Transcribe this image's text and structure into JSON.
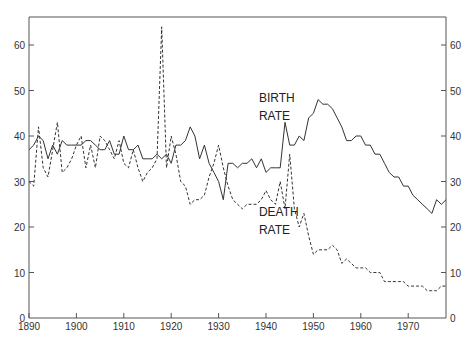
{
  "chart_data": {
    "type": "line",
    "title": "",
    "xlabel": "",
    "ylabel": "",
    "xlim": [
      1890,
      1978
    ],
    "ylim": [
      0,
      66
    ],
    "grid": false,
    "legend": "inline annotations",
    "x_ticks": [
      1890,
      1900,
      1910,
      1920,
      1930,
      1940,
      1950,
      1960,
      1970
    ],
    "y_ticks_left": [
      0,
      10,
      20,
      30,
      40,
      50,
      60
    ],
    "y_ticks_right": [
      0,
      10,
      20,
      30,
      40,
      50,
      60
    ],
    "annotations": [
      {
        "text": "BIRTH",
        "x": 1938.5,
        "y": 47.5
      },
      {
        "text": "RATE",
        "x": 1938.5,
        "y": 43.5
      },
      {
        "text": "DEATH",
        "x": 1938.5,
        "y": 22.5
      },
      {
        "text": "RATE",
        "x": 1938.5,
        "y": 18.5
      }
    ],
    "series": [
      {
        "name": "BIRTH RATE",
        "style": "solid",
        "x": [
          1890,
          1891,
          1892,
          1893,
          1894,
          1895,
          1896,
          1897,
          1898,
          1899,
          1900,
          1901,
          1902,
          1903,
          1904,
          1905,
          1906,
          1907,
          1908,
          1909,
          1910,
          1911,
          1912,
          1913,
          1914,
          1915,
          1916,
          1917,
          1918,
          1919,
          1920,
          1921,
          1922,
          1923,
          1924,
          1925,
          1926,
          1927,
          1928,
          1929,
          1930,
          1931,
          1932,
          1933,
          1934,
          1935,
          1936,
          1937,
          1938,
          1939,
          1940,
          1941,
          1942,
          1943,
          1944,
          1945,
          1946,
          1947,
          1948,
          1949,
          1950,
          1951,
          1952,
          1953,
          1954,
          1955,
          1956,
          1957,
          1958,
          1959,
          1960,
          1961,
          1962,
          1963,
          1964,
          1965,
          1966,
          1967,
          1968,
          1969,
          1970,
          1971,
          1972,
          1973,
          1974,
          1975,
          1976,
          1977,
          1978
        ],
        "values": [
          37,
          38,
          40,
          39,
          35,
          38,
          36,
          39,
          38,
          38,
          38,
          38,
          39,
          39,
          38,
          37,
          37,
          39,
          36,
          36,
          40,
          37,
          37,
          38,
          35,
          35,
          35,
          36,
          35,
          36,
          34,
          38,
          38,
          39,
          42,
          40,
          35,
          38,
          34,
          32,
          30,
          26,
          34,
          34,
          33,
          34,
          34,
          35,
          33,
          35,
          32,
          33,
          33,
          33,
          43,
          38,
          38,
          40,
          39,
          44,
          45,
          48,
          47,
          47,
          46,
          44,
          42,
          39,
          39,
          40,
          40,
          38,
          38,
          36,
          36,
          34,
          32,
          31,
          31,
          29,
          29,
          27,
          26,
          25,
          24,
          23,
          26,
          25,
          26
        ]
      },
      {
        "name": "DEATH RATE",
        "style": "dashed",
        "x": [
          1890,
          1891,
          1892,
          1893,
          1894,
          1895,
          1896,
          1897,
          1898,
          1899,
          1900,
          1901,
          1902,
          1903,
          1904,
          1905,
          1906,
          1907,
          1908,
          1909,
          1910,
          1911,
          1912,
          1913,
          1914,
          1915,
          1916,
          1917,
          1918,
          1919,
          1920,
          1921,
          1922,
          1923,
          1924,
          1925,
          1926,
          1927,
          1928,
          1929,
          1930,
          1931,
          1932,
          1933,
          1934,
          1935,
          1936,
          1937,
          1938,
          1939,
          1940,
          1941,
          1942,
          1943,
          1944,
          1945,
          1946,
          1947,
          1948,
          1949,
          1950,
          1951,
          1952,
          1953,
          1954,
          1955,
          1956,
          1957,
          1958,
          1959,
          1960,
          1961,
          1962,
          1963,
          1964,
          1965,
          1966,
          1967,
          1968,
          1969,
          1970,
          1971,
          1972,
          1973,
          1974,
          1975,
          1976,
          1977,
          1978
        ],
        "values": [
          30,
          29,
          42,
          33,
          31,
          37,
          43,
          32,
          33,
          35,
          38,
          40,
          33,
          38,
          33,
          40,
          39,
          37,
          35,
          39,
          34,
          33,
          37,
          33,
          30,
          32,
          33,
          35,
          64,
          33,
          40,
          36,
          30,
          29,
          25,
          26,
          26,
          27,
          31,
          34,
          38,
          33,
          29,
          26,
          25,
          24,
          25,
          25,
          25,
          26,
          28,
          26,
          25,
          30,
          24,
          36,
          24,
          20,
          23,
          18,
          14,
          15,
          15,
          15,
          16,
          15,
          12,
          13,
          12,
          11,
          11,
          11,
          10,
          10,
          10,
          8,
          8,
          8,
          8,
          8,
          7,
          7,
          7,
          7,
          6,
          6,
          6,
          7,
          7
        ]
      }
    ]
  }
}
